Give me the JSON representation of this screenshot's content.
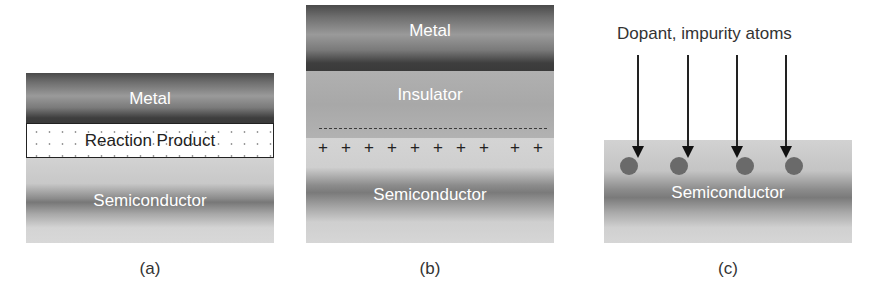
{
  "figure": {
    "panels": [
      {
        "id": "a",
        "caption": "(a)",
        "layers": {
          "metal": "Metal",
          "reaction_product": "Reaction Product",
          "semiconductor": "Semiconductor"
        }
      },
      {
        "id": "b",
        "caption": "(b)",
        "layers": {
          "metal": "Metal",
          "insulator": "Insulator",
          "semiconductor": "Semiconductor"
        },
        "charges": {
          "negative_line": "dashed",
          "positive_symbol": "+",
          "positive_count": 10
        }
      },
      {
        "id": "c",
        "caption": "(c)",
        "title": "Dopant, impurity atoms",
        "layers": {
          "semiconductor": "Semiconductor"
        },
        "arrow_count": 4,
        "atom_count": 4
      }
    ]
  },
  "colors": {
    "metal_dark": "#3e3e3e",
    "insulator": "#ababab",
    "semiconductor_light": "#d4d4d4",
    "atom": "#6a6a6a",
    "text_dark": "#333333",
    "text_light": "#ffffff"
  }
}
